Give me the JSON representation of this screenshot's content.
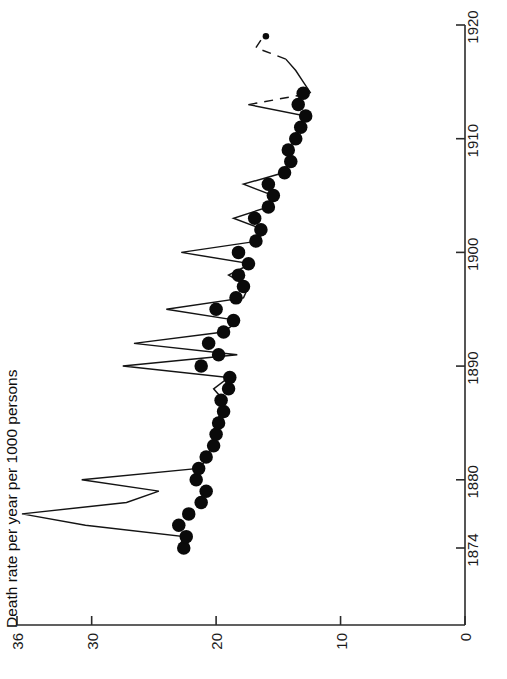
{
  "chart_data": {
    "type": "line",
    "title": "",
    "subtitle": "",
    "orientation": "rotated-90",
    "xlabel": "Death rate per year per 1000 persons",
    "ylabel": "",
    "value_axis": {
      "label": "Death rate per year per 1000 persons",
      "ticks": [
        36,
        30,
        20,
        10,
        0
      ],
      "tick_labels": [
        "36",
        "30",
        "20",
        "10",
        "0"
      ],
      "range": [
        0,
        36
      ],
      "position": "bottom",
      "direction": "reversed"
    },
    "time_axis": {
      "label": "",
      "ticks": [
        1874,
        1880,
        1890,
        1900,
        1910,
        1920
      ],
      "tick_labels": [
        "1874",
        "1880",
        "1890",
        "1900",
        "1910",
        "1920"
      ],
      "range": [
        1873,
        1921
      ],
      "position": "right"
    },
    "grid": false,
    "legend": null,
    "series": [
      {
        "name": "death-rate-line",
        "style": "solid-with-dashed-tail",
        "x": [
          1874,
          1875,
          1876,
          1877,
          1878,
          1879,
          1880,
          1881,
          1882,
          1883,
          1884,
          1885,
          1886,
          1887,
          1888,
          1889,
          1890,
          1891,
          1892,
          1893,
          1894,
          1895,
          1896,
          1897,
          1898,
          1899,
          1900,
          1901,
          1902,
          1903,
          1904,
          1905,
          1906,
          1907,
          1908,
          1909,
          1910,
          1911,
          1912,
          1913,
          1914,
          1915,
          1916,
          1917,
          1918,
          1919
        ],
        "values": [
          23.0,
          22.6,
          30.5,
          35.6,
          27.2,
          24.6,
          30.8,
          21.4,
          20.6,
          20.4,
          20.2,
          20.0,
          19.6,
          19.4,
          20.2,
          19.0,
          27.5,
          18.3,
          26.6,
          19.4,
          18.2,
          24.0,
          17.8,
          17.4,
          19.0,
          17.2,
          22.8,
          16.6,
          16.2,
          18.6,
          15.8,
          15.4,
          17.8,
          14.6,
          14.2,
          14.0,
          13.8,
          13.2,
          12.8,
          17.4,
          12.4,
          13.0,
          13.6,
          14.4,
          16.8,
          16.2
        ],
        "dashed_segments": [
          [
            1913,
            1914
          ],
          [
            1917,
            1918
          ],
          [
            1918,
            1919
          ]
        ]
      },
      {
        "name": "death-rate-points",
        "style": "filled-circle-markers",
        "x": [
          1874,
          1875,
          1876,
          1877,
          1878,
          1879,
          1880,
          1881,
          1882,
          1883,
          1884,
          1885,
          1886,
          1887,
          1888,
          1889,
          1890,
          1891,
          1892,
          1893,
          1894,
          1895,
          1896,
          1897,
          1898,
          1899,
          1900,
          1901,
          1902,
          1903,
          1904,
          1905,
          1906,
          1907,
          1908,
          1909,
          1910,
          1911,
          1912,
          1913,
          1914,
          1919
        ],
        "values": [
          22.6,
          22.4,
          23.0,
          22.2,
          21.2,
          20.8,
          21.6,
          21.4,
          20.8,
          20.2,
          20.0,
          19.8,
          19.4,
          19.6,
          19.0,
          18.9,
          21.2,
          19.8,
          20.6,
          19.4,
          18.6,
          20.0,
          18.4,
          17.8,
          18.2,
          17.4,
          18.2,
          16.8,
          16.4,
          16.9,
          15.8,
          15.4,
          15.8,
          14.5,
          14.0,
          14.2,
          13.6,
          13.2,
          12.8,
          13.4,
          13.0,
          16.0
        ],
        "marker_size": 13.5,
        "outlier_marker_size": 6.5
      }
    ]
  },
  "axes": {
    "value_axis_title": "Death rate per year per 1000 persons",
    "value_ticks": [
      "36",
      "30",
      "20",
      "10",
      "0"
    ],
    "time_ticks": [
      "1874",
      "1880",
      "1890",
      "1900",
      "1910",
      "1920"
    ]
  }
}
